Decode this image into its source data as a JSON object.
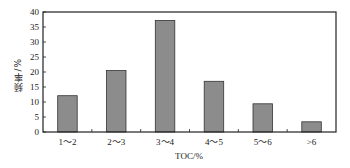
{
  "chart_data": {
    "type": "bar",
    "title": "",
    "xlabel": "TOC/%",
    "ylabel": "频率/%",
    "categories": [
      "1～2",
      "2～3",
      "3～4",
      "4～5",
      "5～6",
      ">6"
    ],
    "values": [
      12.1,
      20.5,
      37.2,
      16.9,
      9.4,
      3.4
    ],
    "ylim": [
      0,
      40
    ],
    "yticks": [
      0,
      5,
      10,
      15,
      20,
      25,
      30,
      35,
      40
    ],
    "grid": false,
    "legend": null,
    "bar_color": "#8c8c8c",
    "bar_edge_color": "#333333"
  }
}
